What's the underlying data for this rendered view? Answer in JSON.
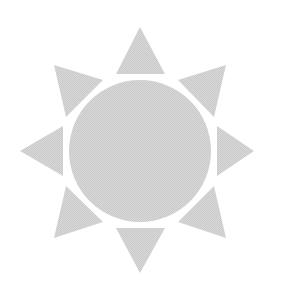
{
  "image": {
    "kind": "vector-icon",
    "subject": "sun",
    "alt_text": "Sun",
    "width": 282,
    "height": 306,
    "background_color": "#ffffff"
  },
  "palette": {
    "fill": "#d2d2d2",
    "background": "#ffffff",
    "texture": "dithered-halftone"
  },
  "sun": {
    "core": {
      "label": "Sun core disc",
      "cx": 140,
      "cy": 151,
      "r": 71,
      "fill": "#d2d2d2"
    },
    "ray_count": 8,
    "ray_gap": 9,
    "rays": [
      {
        "name": "ray-north",
        "label": "North ray",
        "angle_deg": 0,
        "tip_x": 140,
        "tip_y": 27,
        "points": "140,27 165,74 116,74"
      },
      {
        "name": "ray-northeast",
        "label": "Northeast ray",
        "angle_deg": 45,
        "tip_x": 226,
        "tip_y": 65,
        "points": "226,65 214,117 178,80"
      },
      {
        "name": "ray-east",
        "label": "East ray",
        "angle_deg": 90,
        "tip_x": 254,
        "tip_y": 151,
        "points": "254,151 217,176 217,126"
      },
      {
        "name": "ray-southeast",
        "label": "Southeast ray",
        "angle_deg": 135,
        "tip_x": 226,
        "tip_y": 238,
        "points": "226,238 178,222 214,186"
      },
      {
        "name": "ray-south",
        "label": "South ray",
        "angle_deg": 180,
        "tip_x": 140,
        "tip_y": 273,
        "points": "140,273 116,228 165,228"
      },
      {
        "name": "ray-southwest",
        "label": "Southwest ray",
        "angle_deg": 225,
        "tip_x": 54,
        "tip_y": 238,
        "points": "54,238 66,186 103,222"
      },
      {
        "name": "ray-west",
        "label": "West ray",
        "angle_deg": 270,
        "tip_x": 20,
        "tip_y": 151,
        "points": "20,151 63,126 63,176"
      },
      {
        "name": "ray-northwest",
        "label": "Northwest ray",
        "angle_deg": 315,
        "tip_x": 54,
        "tip_y": 65,
        "points": "54,65 103,80 66,117"
      }
    ]
  }
}
